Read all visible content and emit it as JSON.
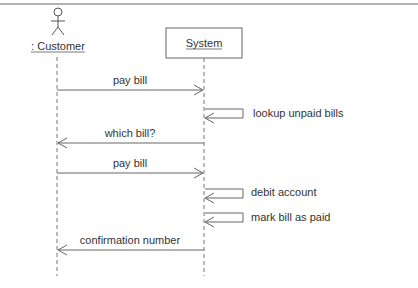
{
  "diagram": {
    "type": "uml-sequence",
    "participants": [
      {
        "id": "customer",
        "label": ": Customer",
        "kind": "actor"
      },
      {
        "id": "system",
        "label": "System",
        "kind": "object"
      }
    ],
    "messages": [
      {
        "label": "pay bill",
        "from": "customer",
        "to": "system"
      },
      {
        "label": "lookup unpaid bills",
        "from": "system",
        "to": "system"
      },
      {
        "label": "which bill?",
        "from": "system",
        "to": "customer"
      },
      {
        "label": "pay bill",
        "from": "customer",
        "to": "system"
      },
      {
        "label": "debit account",
        "from": "system",
        "to": "system"
      },
      {
        "label": "mark bill as paid",
        "from": "system",
        "to": "system"
      },
      {
        "label": "confirmation number",
        "from": "system",
        "to": "customer"
      }
    ],
    "colors": {
      "line": "#666666",
      "text": "#333333",
      "border": "#999999"
    }
  }
}
